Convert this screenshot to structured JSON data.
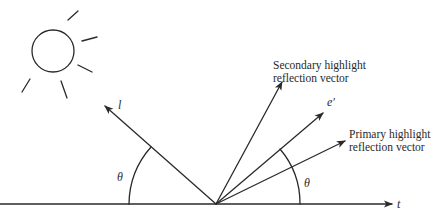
{
  "diagram": {
    "title": "",
    "labels": {
      "light_vector": "l",
      "tangent": "t",
      "eye_prime": "e′",
      "theta_left": "θ",
      "theta_right": "θ",
      "secondary_line1": "Secondary highlight",
      "secondary_line2": "reflection vector",
      "primary_line1": "Primary highlight",
      "primary_line2": "reflection vector"
    },
    "elements": [
      {
        "id": "sun",
        "type": "circle-with-rays",
        "center": [
          53,
          51
        ],
        "radius": 21
      },
      {
        "id": "surface-tangent",
        "type": "arrow",
        "from": [
          0,
          204
        ],
        "to": [
          392,
          204
        ],
        "label": "t"
      },
      {
        "id": "light-vector",
        "type": "arrow",
        "from": [
          216,
          204
        ],
        "to": [
          105,
          106
        ],
        "label": "l"
      },
      {
        "id": "secondary-reflection-vector",
        "type": "arrow",
        "from": [
          216,
          204
        ],
        "to": [
          282,
          82
        ]
      },
      {
        "id": "eye-prime-vector",
        "type": "arrow",
        "from": [
          216,
          204
        ],
        "to": [
          323,
          113
        ],
        "label": "e′"
      },
      {
        "id": "primary-reflection-vector",
        "type": "arrow",
        "from": [
          216,
          204
        ],
        "to": [
          345,
          141
        ]
      },
      {
        "id": "angle-left",
        "type": "arc",
        "label": "θ"
      },
      {
        "id": "angle-right",
        "type": "arc",
        "label": "θ"
      }
    ],
    "colors": {
      "ink": "#2a2a2a",
      "background": "#ffffff"
    }
  }
}
